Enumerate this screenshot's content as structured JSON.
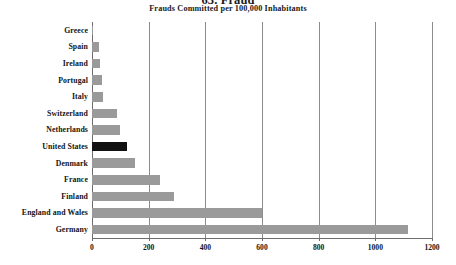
{
  "chart_data": {
    "type": "bar",
    "orientation": "horizontal",
    "title": "63. Fraud",
    "subtitle": "Frauds Committed per 100,000 Inhabitants",
    "xlabel": "",
    "ylabel": "",
    "xlim": [
      0,
      1200
    ],
    "xticks": [
      0,
      200,
      400,
      600,
      800,
      1000,
      1200
    ],
    "xtick_labels": [
      "0",
      "200",
      "400",
      "600",
      "800",
      "1000",
      "1200"
    ],
    "grid": true,
    "grid_axis": "x",
    "legend": false,
    "highlight_category": "United States",
    "colors": {
      "bar": "#9a9a9a",
      "highlight_bar": "#111111",
      "gridline": "#8c8c8c",
      "axis": "#6d6d6d",
      "text": "#141414",
      "background": "#ffffff"
    },
    "categories": [
      "Greece",
      "Spain",
      "Ireland",
      "Portugal",
      "Italy",
      "Switzerland",
      "Netherlands",
      "United States",
      "Denmark",
      "France",
      "Finland",
      "England and Wales",
      "Germany"
    ],
    "values": [
      4,
      25,
      27,
      36,
      38,
      88,
      100,
      124,
      152,
      240,
      290,
      600,
      1115
    ],
    "bars": [
      {
        "category": "Greece",
        "value": 4,
        "highlight": false
      },
      {
        "category": "Spain",
        "value": 25,
        "highlight": false
      },
      {
        "category": "Ireland",
        "value": 27,
        "highlight": false
      },
      {
        "category": "Portugal",
        "value": 36,
        "highlight": false
      },
      {
        "category": "Italy",
        "value": 38,
        "highlight": false
      },
      {
        "category": "Switzerland",
        "value": 88,
        "highlight": false
      },
      {
        "category": "Netherlands",
        "value": 100,
        "highlight": false
      },
      {
        "category": "United States",
        "value": 124,
        "highlight": true
      },
      {
        "category": "Denmark",
        "value": 152,
        "highlight": false
      },
      {
        "category": "France",
        "value": 240,
        "highlight": false
      },
      {
        "category": "Finland",
        "value": 290,
        "highlight": false
      },
      {
        "category": "England and Wales",
        "value": 600,
        "highlight": false
      },
      {
        "category": "Germany",
        "value": 1115,
        "highlight": false
      }
    ]
  }
}
